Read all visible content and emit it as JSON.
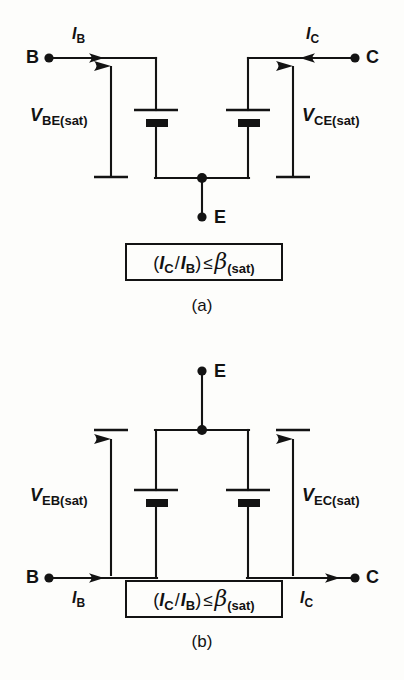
{
  "figures": [
    {
      "id": "a",
      "caption": "(a)",
      "device": "npn",
      "terminals": {
        "base": "B",
        "collector": "C",
        "emitter": "E"
      },
      "currents": [
        {
          "name": "base-current",
          "symbol": "I",
          "subscript": "B",
          "label": "I_B",
          "direction": "right",
          "position": "above-wire"
        },
        {
          "name": "collector-current",
          "symbol": "I",
          "subscript": "C",
          "label": "I_C",
          "direction": "left",
          "position": "above-wire"
        }
      ],
      "voltages": [
        {
          "name": "base-emitter-saturation-voltage",
          "symbol": "V",
          "subscript": "BE(sat)",
          "label": "V_BE(sat)",
          "arrow": "up"
        },
        {
          "name": "collector-emitter-saturation-voltage",
          "symbol": "V",
          "subscript": "CE(sat)",
          "label": "V_CE(sat)",
          "arrow": "up"
        }
      ],
      "equation": {
        "open": "(",
        "num_symbol": "I",
        "num_sub": "C",
        "slash": "/",
        "den_symbol": "I",
        "den_sub": "B",
        "close": ")",
        "operator": "≤",
        "beta": "β",
        "beta_sub": "(sat)",
        "plain": "(I_C / I_B) ≤ β_(sat)"
      }
    },
    {
      "id": "b",
      "caption": "(b)",
      "device": "pnp",
      "terminals": {
        "base": "B",
        "collector": "C",
        "emitter": "E"
      },
      "currents": [
        {
          "name": "base-current",
          "symbol": "I",
          "subscript": "B",
          "label": "I_B",
          "direction": "right",
          "position": "below-wire"
        },
        {
          "name": "collector-current",
          "symbol": "I",
          "subscript": "C",
          "label": "I_C",
          "direction": "right",
          "position": "below-wire"
        }
      ],
      "voltages": [
        {
          "name": "emitter-base-saturation-voltage",
          "symbol": "V",
          "subscript": "EB(sat)",
          "label": "V_EB(sat)",
          "arrow": "up"
        },
        {
          "name": "emitter-collector-saturation-voltage",
          "symbol": "V",
          "subscript": "EC(sat)",
          "label": "V_EC(sat)",
          "arrow": "up"
        }
      ],
      "equation": {
        "open": "(",
        "num_symbol": "I",
        "num_sub": "C",
        "slash": "/",
        "den_symbol": "I",
        "den_sub": "B",
        "close": ")",
        "operator": "≤",
        "beta": "β",
        "beta_sub": "(sat)",
        "plain": "(I_C / I_B) ≤ β_(sat)"
      }
    }
  ],
  "colors": {
    "ink": "#131313",
    "paper": "#fdfdfb",
    "ghost": "#d8d8d4"
  }
}
